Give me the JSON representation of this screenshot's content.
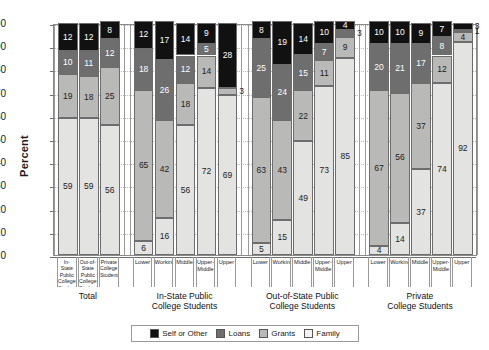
{
  "chart_data": {
    "type": "bar",
    "subtype": "stacked-bar",
    "title": "",
    "xlabel": "",
    "ylabel": "Percent",
    "ylim": [
      0,
      100
    ],
    "yticks": [
      0,
      10,
      20,
      30,
      40,
      50,
      60,
      70,
      80,
      90,
      100
    ],
    "grid": true,
    "legend_position": "bottom",
    "stack_order_bottom_to_top": [
      "Family",
      "Grants",
      "Loans",
      "Self or Other"
    ],
    "series": [
      {
        "name": "Family",
        "color": "#e3e3e1",
        "values": [
          59,
          59,
          56,
          6,
          16,
          56,
          72,
          69,
          5,
          15,
          49,
          73,
          85,
          4,
          14,
          37,
          74,
          92
        ]
      },
      {
        "name": "Grants",
        "color": "#b9b9b7",
        "values": [
          19,
          18,
          25,
          65,
          42,
          18,
          14,
          3,
          63,
          43,
          22,
          11,
          9,
          67,
          56,
          37,
          12,
          4
        ]
      },
      {
        "name": "Loans",
        "color": "#6e6e6e",
        "values": [
          10,
          11,
          12,
          18,
          26,
          12,
          5,
          0,
          25,
          24,
          15,
          7,
          3,
          20,
          21,
          17,
          8,
          1
        ]
      },
      {
        "name": "Self or Other",
        "color": "#111111",
        "values": [
          12,
          12,
          8,
          12,
          17,
          14,
          9,
          28,
          8,
          19,
          14,
          10,
          4,
          10,
          10,
          9,
          7,
          3
        ]
      }
    ],
    "categories": [
      "In-State Public College Students",
      "Out-of-State Public College Students",
      "Private College Students",
      "Lower",
      "Working",
      "Middle",
      "Upper-Middle",
      "Upper",
      "Lower",
      "Working",
      "Middle",
      "Upper-Middle",
      "Upper",
      "Lower",
      "Working",
      "Middle",
      "Upper-Middle",
      "Upper"
    ],
    "groups": [
      {
        "title": "Total",
        "bars": [
          {
            "label": "In-State Public College Students",
            "label_lines": [
              "In-State",
              "Public",
              "College",
              "Students"
            ],
            "Family": 59,
            "Grants": 19,
            "Loans": 10,
            "Self or Other": 12
          },
          {
            "label": "Out-of-State Public College Students",
            "label_lines": [
              "Out-of-",
              "State",
              "Public",
              "College",
              "Students"
            ],
            "Family": 59,
            "Grants": 18,
            "Loans": 11,
            "Self or Other": 12
          },
          {
            "label": "Private College Students",
            "label_lines": [
              "Private",
              "College",
              "Students"
            ],
            "Family": 56,
            "Grants": 25,
            "Loans": 12,
            "Self or Other": 8
          }
        ]
      },
      {
        "title": "In-State Public College Students",
        "title_lines": [
          "In-State Public",
          "College Students"
        ],
        "bars": [
          {
            "label": "Lower",
            "label_lines": [
              "Lower"
            ],
            "Family": 6,
            "Grants": 65,
            "Loans": 18,
            "Self or Other": 12
          },
          {
            "label": "Working",
            "label_lines": [
              "Working"
            ],
            "Family": 16,
            "Grants": 42,
            "Loans": 26,
            "Self or Other": 17
          },
          {
            "label": "Middle",
            "label_lines": [
              "Middle"
            ],
            "Family": 56,
            "Grants": 18,
            "Loans": 12,
            "Self or Other": 14
          },
          {
            "label": "Upper-Middle",
            "label_lines": [
              "Upper-",
              "Middle"
            ],
            "Family": 72,
            "Grants": 14,
            "Loans": 5,
            "Self or Other": 9
          },
          {
            "label": "Upper",
            "label_lines": [
              "Upper"
            ],
            "Family": 69,
            "Grants": 3,
            "Loans": 0,
            "Self or Other": 28
          }
        ]
      },
      {
        "title": "Out-of-State Public College Students",
        "title_lines": [
          "Out-of-State Public",
          "College Students"
        ],
        "bars": [
          {
            "label": "Lower",
            "label_lines": [
              "Lower"
            ],
            "Family": 5,
            "Grants": 63,
            "Loans": 25,
            "Self or Other": 8
          },
          {
            "label": "Working",
            "label_lines": [
              "Working"
            ],
            "Family": 15,
            "Grants": 43,
            "Loans": 24,
            "Self or Other": 19
          },
          {
            "label": "Middle",
            "label_lines": [
              "Middle"
            ],
            "Family": 49,
            "Grants": 22,
            "Loans": 15,
            "Self or Other": 14
          },
          {
            "label": "Upper-Middle",
            "label_lines": [
              "Upper-",
              "Middle"
            ],
            "Family": 73,
            "Grants": 11,
            "Loans": 7,
            "Self or Other": 10
          },
          {
            "label": "Upper",
            "label_lines": [
              "Upper"
            ],
            "Family": 85,
            "Grants": 9,
            "Loans": 3,
            "Self or Other": 4
          }
        ]
      },
      {
        "title": "Private College Students",
        "title_lines": [
          "Private",
          "College Students"
        ],
        "bars": [
          {
            "label": "Lower",
            "label_lines": [
              "Lower"
            ],
            "Family": 4,
            "Grants": 67,
            "Loans": 20,
            "Self or Other": 10
          },
          {
            "label": "Working",
            "label_lines": [
              "Working"
            ],
            "Family": 14,
            "Grants": 56,
            "Loans": 21,
            "Self or Other": 10
          },
          {
            "label": "Middle",
            "label_lines": [
              "Middle"
            ],
            "Family": 37,
            "Grants": 37,
            "Loans": 17,
            "Self or Other": 9
          },
          {
            "label": "Upper-Middle",
            "label_lines": [
              "Upper-",
              "Middle"
            ],
            "Family": 74,
            "Grants": 12,
            "Loans": 8,
            "Self or Other": 7
          },
          {
            "label": "Upper",
            "label_lines": [
              "Upper"
            ],
            "Family": 92,
            "Grants": 4,
            "Loans": 1,
            "Self or Other": 3
          }
        ]
      }
    ],
    "legend": [
      {
        "label": "Self or Other",
        "key": "Self or Other",
        "swatch": "self"
      },
      {
        "label": "Loans",
        "key": "Loans",
        "swatch": "loans"
      },
      {
        "label": "Grants",
        "key": "Grants",
        "swatch": "grants"
      },
      {
        "label": "Family",
        "key": "Family",
        "swatch": "family"
      }
    ]
  }
}
